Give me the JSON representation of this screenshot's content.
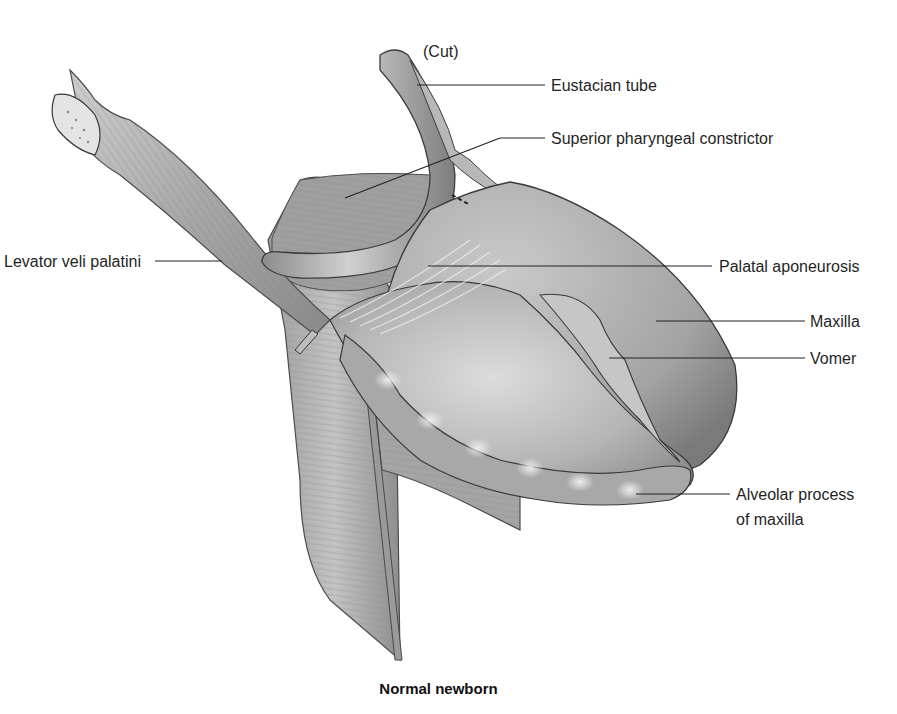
{
  "figure": {
    "caption": "Normal newborn",
    "colors": {
      "background": "#ffffff",
      "tissue_light": "#d9d9d9",
      "tissue_mid": "#a9a9a9",
      "tissue_dark": "#6e6e6e",
      "outline": "#3a3a3a",
      "leader_line": "#222222",
      "label_text": "#1f1f1f"
    },
    "labels": [
      {
        "id": "cut",
        "text": "(Cut)"
      },
      {
        "id": "eustacian-tube",
        "text": "Eustacian tube"
      },
      {
        "id": "superior-pharyngeal-constrictor",
        "text": "Superior pharyngeal constrictor"
      },
      {
        "id": "levator-veli-palatini",
        "text": "Levator veli palatini"
      },
      {
        "id": "palatal-aponeurosis",
        "text": "Palatal aponeurosis"
      },
      {
        "id": "maxilla",
        "text": "Maxilla"
      },
      {
        "id": "vomer",
        "text": "Vomer"
      },
      {
        "id": "alveolar-process-line1",
        "text": "Alveolar process"
      },
      {
        "id": "alveolar-process-line2",
        "text": "of maxilla"
      }
    ]
  }
}
